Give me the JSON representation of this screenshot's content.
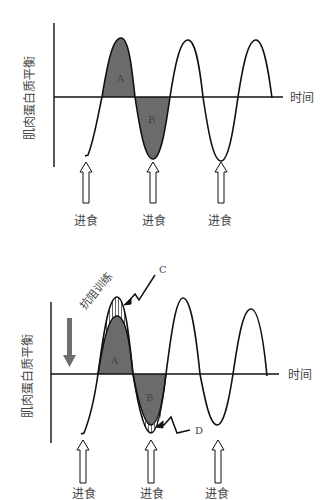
{
  "diagrams": [
    {
      "id": "baseline",
      "y_axis_label": "肌肉蛋白质平衡",
      "x_axis_label": "时间",
      "regions": [
        {
          "label": "A",
          "meaning": "positive balance area (shaded)"
        },
        {
          "label": "B",
          "meaning": "negative balance area (shaded)"
        }
      ],
      "meal_labels": [
        "进食",
        "进食",
        "进食"
      ]
    },
    {
      "id": "with_training",
      "y_axis_label": "肌肉蛋白质平衡",
      "x_axis_label": "时间",
      "annotation_text": "抗阻训练",
      "regions": [
        {
          "label": "A",
          "meaning": "positive balance area (shaded)"
        },
        {
          "label": "B",
          "meaning": "negative balance area (shaded)"
        }
      ],
      "callouts": [
        "C",
        "D"
      ],
      "meal_labels": [
        "进食",
        "进食",
        "进食"
      ]
    }
  ],
  "colors": {
    "line": "#111111",
    "shade": "#6b6b6b",
    "gray_arrow": "#6e6e6e",
    "text": "#444444"
  }
}
